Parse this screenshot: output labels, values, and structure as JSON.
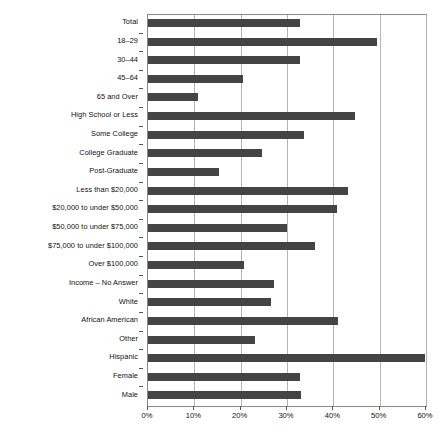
{
  "chart_data": {
    "type": "bar",
    "orientation": "horizontal",
    "title": "",
    "xlabel": "",
    "ylabel": "",
    "xlim": [
      0,
      60
    ],
    "grid": true,
    "legend": false,
    "bar_color": "#444444",
    "gridline_color": "#b5b5b5",
    "axis_color": "#8a8a8a",
    "xticks": [
      0,
      10,
      20,
      30,
      40,
      50,
      60
    ],
    "xticklabels": [
      "0%",
      "10%",
      "20%",
      "30%",
      "40%",
      "50%",
      "60%"
    ],
    "categories": [
      "Total",
      "18–29",
      "30–44",
      "45–64",
      "65 and Over",
      "High School or Less",
      "Some College",
      "College Graduate",
      "Post-Graduate",
      "Less than $20,000",
      "$20,000 to under $50,000",
      "$50,000 to under $75,000",
      "$75,000 to under $100,000",
      "Over $100,000",
      "Income – No Answer",
      "White",
      "African American",
      "Other",
      "Hispanic",
      "Female",
      "Male"
    ],
    "values": [
      32.9,
      49.5,
      32.8,
      20.5,
      10.8,
      44.6,
      33.6,
      24.6,
      15.4,
      43.1,
      40.8,
      30.0,
      36.1,
      20.8,
      27.1,
      26.5,
      41.1,
      23.2,
      59.7,
      32.9,
      33.1
    ]
  }
}
